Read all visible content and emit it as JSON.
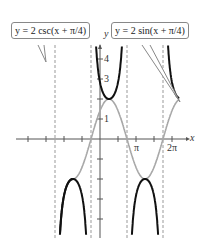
{
  "chart_data": {
    "type": "line",
    "title": "",
    "xlabel": "x",
    "ylabel": "y",
    "x_ticks": [
      "π",
      "2π"
    ],
    "y_ticks": [
      "1",
      "3",
      "4"
    ],
    "x_range": [
      -2.7,
      2.35
    ],
    "y_range": [
      -4.5,
      5
    ],
    "series": [
      {
        "name": "y = 2 csc(x + π/4)",
        "color": "#111111",
        "style": "solid thick"
      },
      {
        "name": "y = 2 sin(x + π/4)",
        "color": "#a0a0a0",
        "style": "solid"
      }
    ],
    "asymptotes": [
      "x = -5π/4",
      "x = -π/4",
      "x = 3π/4",
      "x = 7π/4"
    ]
  },
  "labels": {
    "csc": "y = 2 csc(x + π/4)",
    "sin": "y = 2 sin(x + π/4)",
    "x_axis": "x",
    "y_axis": "y",
    "pi": "π",
    "two_pi": "2π",
    "y1": "1",
    "y3": "3",
    "y4": "4"
  }
}
